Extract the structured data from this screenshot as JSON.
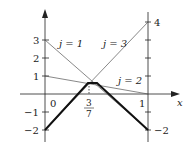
{
  "figure": {
    "type": "piecewise-linear diagram",
    "x_axis_label": "x",
    "left_axis_ticks": [
      "3",
      "2",
      "1",
      "0",
      "−1",
      "−2"
    ],
    "right_axis_ticks": [
      "4",
      "−2"
    ],
    "x_ticks": {
      "zero": "0",
      "one": "1",
      "frac_num": "3",
      "frac_den": "7"
    },
    "lines": [
      {
        "label": "j = 1",
        "from": [
          0,
          3
        ],
        "to": [
          1,
          -2
        ]
      },
      {
        "label": "j = 2",
        "from": [
          0,
          1
        ],
        "to": [
          1,
          0
        ]
      },
      {
        "label": "j = 3",
        "from": [
          0,
          -2
        ],
        "to": [
          1,
          4
        ]
      }
    ],
    "envelope": {
      "label": "lower envelope (bold)",
      "points": [
        [
          0,
          -2
        ],
        [
          0.4286,
          0.7
        ],
        [
          0.5,
          0.7
        ],
        [
          1,
          -2
        ]
      ]
    },
    "colors": {
      "ink": "#222222",
      "thin": "#555555",
      "background": "#ffffff"
    }
  }
}
